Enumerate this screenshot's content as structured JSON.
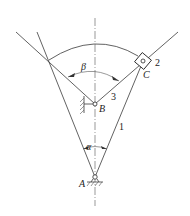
{
  "diagram": {
    "type": "mechanism-linkage",
    "labels": {
      "angle_beta": "β",
      "angle_alpha": "α",
      "point_a": "A",
      "point_b": "B",
      "point_c": "C",
      "link_1": "1",
      "link_2": "2",
      "link_3": "3"
    },
    "colors": {
      "line": "#3a3a3a",
      "background": "#ffffff"
    }
  }
}
